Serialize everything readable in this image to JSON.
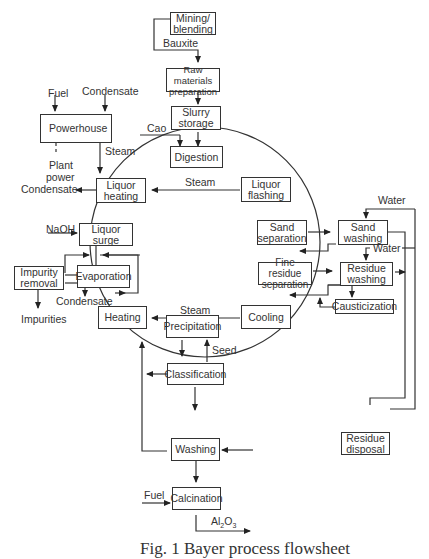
{
  "diagram": {
    "type": "process-flowsheet",
    "caption": "Fig. 1  Bayer process flowsheet",
    "nodes": {
      "mining": "Mining/\nblending",
      "raw": "Raw materials\npreparation",
      "slurry": "Slurry\nstorage",
      "digestion": "Digestion",
      "powerhouse": "Powerhouse",
      "liquor_heating": "Liquor\nheating",
      "liquor_flashing": "Liquor\nflashing",
      "liquor_surge": "Liquor surge",
      "sand_separation": "Sand\nseparation",
      "sand_washing": "Sand\nwashing",
      "impurity_removal": "Impurity\nremoval",
      "evaporation": "Evaporation",
      "fine_residue": "Fine residue\nseparation",
      "residue_washing": "Residue\nwashing",
      "causticization": "Causticization",
      "heating": "Heating",
      "cooling": "Cooling",
      "precipitation": "Precipitation",
      "classification": "Classification",
      "washing": "Washing",
      "calcination": "Calcination",
      "residue_disposal": "Residue\ndisposal"
    },
    "labels": {
      "bauxite": "Bauxite",
      "fuel_top": "Fuel",
      "condensate_top": "Condensate",
      "cao": "Cao",
      "steam_power": "Steam",
      "plant": "Plant",
      "power": "power",
      "condensate_left": "Condensate",
      "steam_flash": "Steam",
      "naoh": "NaOH",
      "water_top": "Water",
      "water_mid": "Water",
      "condensate_evap": "Condensate",
      "impurities": "Impurities",
      "steam_cool": "Steam",
      "seed": "Seed",
      "fuel_bottom": "Fuel",
      "al2o3_main": "Al",
      "al2o3_sub1": "2",
      "al2o3_mid": "O",
      "al2o3_sub2": "3"
    }
  }
}
